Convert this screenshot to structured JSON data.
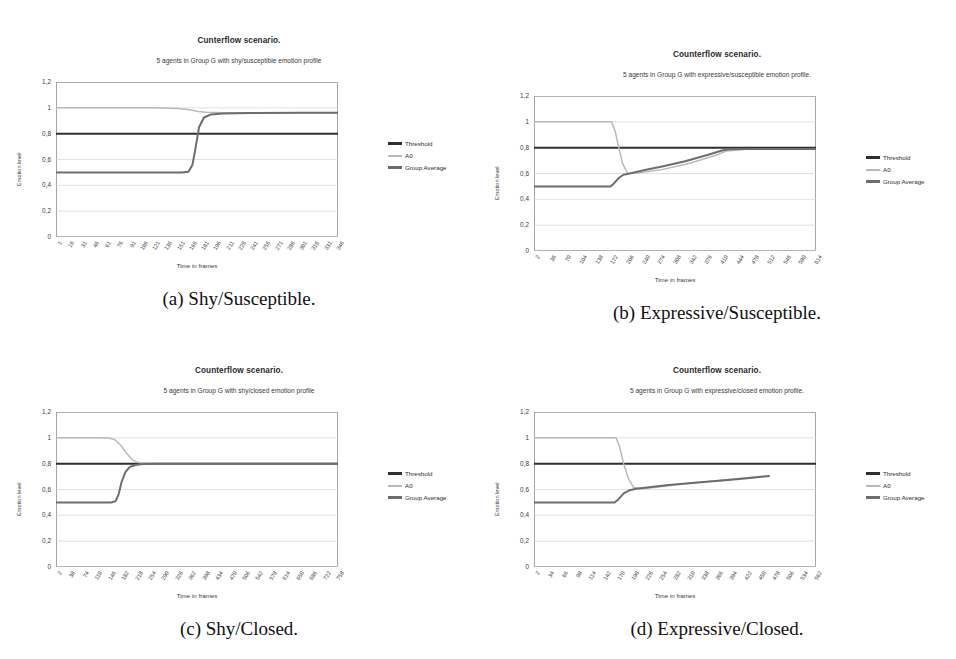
{
  "page": {
    "background": "#ffffff",
    "width": 956,
    "height": 659
  },
  "palette": {
    "threshold": "#2f2f2f",
    "a0": "#b9b9b9",
    "group_average": "#6d6d6d",
    "axis": "#808080",
    "grid": "#cfcfcf",
    "text": "#333333"
  },
  "common": {
    "xlabel": "Time in frames",
    "ylabel": "Emotion level",
    "yticks": [
      "1,2",
      "1",
      "0,8",
      "0,6",
      "0,4",
      "0,2",
      "0"
    ],
    "legend": [
      {
        "label": "Threshold",
        "color": "#2f2f2f",
        "weight": "thick"
      },
      {
        "label": "A0",
        "color": "#b9b9b9",
        "weight": "thin"
      },
      {
        "label": "Group Average",
        "color": "#6d6d6d",
        "weight": "thick"
      }
    ]
  },
  "figures": [
    {
      "id": "a",
      "caption": "(a) Shy/Susceptible.",
      "chart_data": {
        "type": "line",
        "title": "Cunterflow scenario.",
        "subtitle": "5 agents in Group G with shy/susceptible emotion profile",
        "xlabel": "Time in frames",
        "ylabel": "Emotion level",
        "ylim": [
          0,
          1.2
        ],
        "yticks": [
          0,
          0.2,
          0.4,
          0.6,
          0.8,
          1,
          1.2
        ],
        "grid": true,
        "legend_position": "right",
        "xticklabels": [
          "1",
          "16",
          "31",
          "46",
          "61",
          "76",
          "91",
          "106",
          "121",
          "136",
          "151",
          "166",
          "181",
          "196",
          "211",
          "226",
          "241",
          "256",
          "271",
          "286",
          "301",
          "316",
          "331",
          "346"
        ],
        "xlim": [
          1,
          346
        ],
        "series": [
          {
            "name": "Threshold",
            "color": "#2f2f2f",
            "x": [
              1,
              346
            ],
            "values": [
              0.8,
              0.8
            ]
          },
          {
            "name": "A0",
            "color": "#b9b9b9",
            "x": [
              1,
              60,
              120,
              150,
              165,
              175,
              185,
              200,
              260,
              346
            ],
            "values": [
              1.0,
              1.0,
              1.0,
              0.995,
              0.985,
              0.972,
              0.966,
              0.963,
              0.962,
              0.962
            ]
          },
          {
            "name": "Group Average",
            "color": "#6d6d6d",
            "x": [
              1,
              60,
              120,
              155,
              163,
              168,
              172,
              176,
              182,
              190,
              205,
              240,
              300,
              346
            ],
            "values": [
              0.5,
              0.5,
              0.5,
              0.5,
              0.505,
              0.56,
              0.7,
              0.85,
              0.925,
              0.948,
              0.957,
              0.96,
              0.961,
              0.962
            ]
          }
        ]
      }
    },
    {
      "id": "b",
      "caption": "(b) Expressive/Susceptible.",
      "chart_data": {
        "type": "line",
        "title": "Counterflow scenario.",
        "subtitle": "5 agents in Group G with expressive/susceptible emotion profile.",
        "xlabel": "Time in frames",
        "ylabel": "Emotion level",
        "ylim": [
          0,
          1.2
        ],
        "yticks": [
          0,
          0.2,
          0.4,
          0.6,
          0.8,
          1,
          1.2
        ],
        "grid": true,
        "legend_position": "right",
        "xticklabels": [
          "2",
          "36",
          "70",
          "104",
          "138",
          "172",
          "206",
          "240",
          "274",
          "308",
          "342",
          "376",
          "410",
          "444",
          "478",
          "512",
          "546",
          "580",
          "614"
        ],
        "xlim": [
          2,
          614
        ],
        "series": [
          {
            "name": "Threshold",
            "color": "#2f2f2f",
            "x": [
              2,
              614
            ],
            "values": [
              0.8,
              0.8
            ]
          },
          {
            "name": "A0",
            "color": "#b9b9b9",
            "x": [
              2,
              100,
              170,
              178,
              186,
              194,
              205,
              230,
              280,
              340,
              400,
              420,
              470,
              520,
              614
            ],
            "values": [
              1.0,
              1.0,
              1.0,
              0.93,
              0.8,
              0.68,
              0.6,
              0.605,
              0.63,
              0.68,
              0.745,
              0.775,
              0.79,
              0.79,
              0.79
            ]
          },
          {
            "name": "Group Average",
            "color": "#6d6d6d",
            "x": [
              2,
              100,
              168,
              176,
              186,
              196,
              210,
              240,
              280,
              330,
              380,
              410,
              425,
              460,
              520,
              614
            ],
            "values": [
              0.5,
              0.5,
              0.5,
              0.525,
              0.565,
              0.59,
              0.6,
              0.625,
              0.655,
              0.695,
              0.745,
              0.778,
              0.788,
              0.79,
              0.79,
              0.79
            ]
          }
        ]
      }
    },
    {
      "id": "c",
      "caption": "(c) Shy/Closed.",
      "chart_data": {
        "type": "line",
        "title": "Counterflow scenario.",
        "subtitle": "5 agents in Group G with shy/closed emotion profile",
        "xlabel": "Time in frames",
        "ylabel": "Emotion level",
        "ylim": [
          0,
          1.2
        ],
        "yticks": [
          0,
          0.2,
          0.4,
          0.6,
          0.8,
          1,
          1.2
        ],
        "grid": true,
        "legend_position": "right",
        "xticklabels": [
          "2",
          "38",
          "74",
          "110",
          "146",
          "182",
          "218",
          "254",
          "290",
          "326",
          "362",
          "398",
          "434",
          "470",
          "506",
          "542",
          "578",
          "614",
          "650",
          "686",
          "722",
          "758"
        ],
        "xlim": [
          2,
          758
        ],
        "series": [
          {
            "name": "Threshold",
            "color": "#2f2f2f",
            "x": [
              2,
              758
            ],
            "values": [
              0.8,
              0.8
            ]
          },
          {
            "name": "A0",
            "color": "#b9b9b9",
            "x": [
              2,
              100,
              145,
              160,
              175,
              190,
              205,
              215,
              230,
              260,
              320,
              500,
              758
            ],
            "values": [
              1.0,
              1.0,
              0.998,
              0.985,
              0.945,
              0.885,
              0.835,
              0.815,
              0.805,
              0.8,
              0.8,
              0.8,
              0.8
            ]
          },
          {
            "name": "Group Average",
            "color": "#6d6d6d",
            "x": [
              2,
              100,
              150,
              162,
              170,
              178,
              188,
              200,
              215,
              235,
              270,
              340,
              500,
              758
            ],
            "values": [
              0.5,
              0.5,
              0.5,
              0.51,
              0.565,
              0.66,
              0.735,
              0.775,
              0.79,
              0.797,
              0.8,
              0.8,
              0.8,
              0.8
            ]
          }
        ]
      }
    },
    {
      "id": "d",
      "caption": "(d) Expressive/Closed.",
      "chart_data": {
        "type": "line",
        "title": "Counterflow scenario.",
        "subtitle": "5 agents in Group G with expressive/closed emotion profile.",
        "xlabel": "Time in frames",
        "ylabel": "Emotion level",
        "ylim": [
          0,
          1.2
        ],
        "yticks": [
          0,
          0.2,
          0.4,
          0.6,
          0.8,
          1,
          1.2
        ],
        "grid": true,
        "legend_position": "right",
        "xticklabels": [
          "2",
          "34",
          "66",
          "98",
          "114",
          "142",
          "170",
          "198",
          "226",
          "254",
          "282",
          "310",
          "338",
          "366",
          "394",
          "422",
          "450",
          "478",
          "506",
          "534",
          "562"
        ],
        "xlim": [
          2,
          562
        ],
        "series": [
          {
            "name": "Threshold",
            "color": "#2f2f2f",
            "x": [
              2,
              562
            ],
            "values": [
              0.8,
              0.8
            ]
          },
          {
            "name": "A0",
            "color": "#b9b9b9",
            "x": [
              2,
              100,
              165,
              172,
              180,
              190,
              200,
              215,
              240,
              280,
              330,
              380,
              420,
              450,
              470
            ],
            "values": [
              1.0,
              1.0,
              1.0,
              0.93,
              0.8,
              0.68,
              0.615,
              0.605,
              0.615,
              0.635,
              0.655,
              0.675,
              0.69,
              0.7,
              0.705
            ]
          },
          {
            "name": "Group Average",
            "color": "#6d6d6d",
            "x": [
              2,
              100,
              162,
              170,
              180,
              192,
              205,
              230,
              270,
              320,
              370,
              410,
              440,
              465,
              470
            ],
            "values": [
              0.5,
              0.5,
              0.5,
              0.525,
              0.57,
              0.595,
              0.605,
              0.618,
              0.635,
              0.652,
              0.668,
              0.682,
              0.693,
              0.703,
              0.705
            ]
          }
        ]
      }
    }
  ]
}
